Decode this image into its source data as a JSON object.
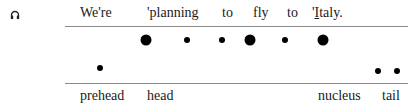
{
  "icon": "headphones-icon",
  "sentence": {
    "words": [
      {
        "text": "We're",
        "x": 80
      },
      {
        "text": "'planning",
        "x": 147
      },
      {
        "text": "to",
        "x": 222
      },
      {
        "text": "fly",
        "x": 253
      },
      {
        "text": "to",
        "x": 287
      },
      {
        "text": "'",
        "x": 312
      },
      {
        "text": "I",
        "x": 315
      },
      {
        "text": "taly.",
        "x": 320
      }
    ]
  },
  "pitch_dots": [
    {
      "x": 146,
      "y": 40,
      "size": "big"
    },
    {
      "x": 187,
      "y": 40,
      "size": "small"
    },
    {
      "x": 222,
      "y": 40,
      "size": "small"
    },
    {
      "x": 250,
      "y": 40,
      "size": "big"
    },
    {
      "x": 285,
      "y": 40,
      "size": "small"
    },
    {
      "x": 323,
      "y": 40,
      "size": "big"
    },
    {
      "x": 100,
      "y": 68,
      "size": "small"
    },
    {
      "x": 378,
      "y": 71,
      "size": "small"
    },
    {
      "x": 397,
      "y": 71,
      "size": "small"
    }
  ],
  "labels": [
    {
      "text": "prehead",
      "x": 80
    },
    {
      "text": "head",
      "x": 147
    },
    {
      "text": "nucleus",
      "x": 318
    },
    {
      "text": "tail",
      "x": 382
    }
  ]
}
